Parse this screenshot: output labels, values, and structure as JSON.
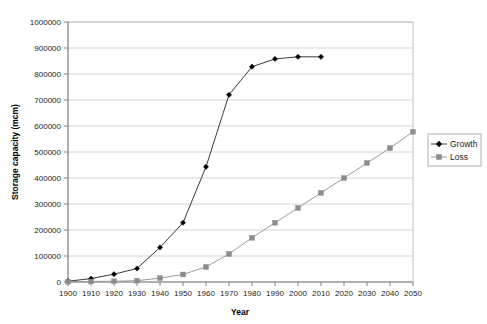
{
  "chart_data": {
    "type": "line",
    "title": "",
    "xlabel": "Year",
    "ylabel": "Storage capacity (mcm)",
    "x": [
      1900,
      1910,
      1920,
      1930,
      1940,
      1950,
      1960,
      1970,
      1980,
      1990,
      2000,
      2010,
      2020,
      2030,
      2040,
      2050
    ],
    "categories": [
      "1900",
      "1910",
      "1920",
      "1930",
      "1940",
      "1950",
      "1960",
      "1970",
      "1980",
      "1990",
      "2000",
      "2010",
      "2020",
      "2030",
      "2040",
      "2050"
    ],
    "series": [
      {
        "name": "Growth",
        "marker": "diamond",
        "color": "#000000",
        "x": [
          1900,
          1910,
          1920,
          1930,
          1940,
          1950,
          1960,
          1970,
          1980,
          1990,
          2000,
          2010
        ],
        "values": [
          3000,
          13000,
          30000,
          52000,
          133000,
          228000,
          443000,
          720000,
          828000,
          858000,
          866000,
          866000
        ]
      },
      {
        "name": "Loss",
        "marker": "square",
        "color": "#8c8c8c",
        "x": [
          1900,
          1910,
          1920,
          1930,
          1940,
          1950,
          1960,
          1970,
          1980,
          1990,
          2000,
          2010,
          2020,
          2030,
          2040,
          2050
        ],
        "values": [
          1000,
          2000,
          3000,
          5000,
          15000,
          29000,
          58000,
          108000,
          170000,
          228000,
          285000,
          343000,
          400000,
          458000,
          515000,
          578000
        ]
      }
    ],
    "xlim": [
      1900,
      2050
    ],
    "ylim": [
      0,
      1000000
    ],
    "ytick_step": 100000,
    "ytick_labels": [
      "0",
      "100000",
      "200000",
      "300000",
      "400000",
      "500000",
      "600000",
      "700000",
      "800000",
      "900000",
      "1000000"
    ],
    "grid": "horizontal",
    "legend_position": "right",
    "legend_entries": [
      "Growth",
      "Loss"
    ]
  },
  "axes": {
    "y_title": "Storage capacity (mcm)",
    "x_title": "Year"
  },
  "legend": {
    "items": [
      {
        "label": "Growth"
      },
      {
        "label": "Loss"
      }
    ]
  },
  "yticks": {
    "t0": "0",
    "t1": "100000",
    "t2": "200000",
    "t3": "300000",
    "t4": "400000",
    "t5": "500000",
    "t6": "600000",
    "t7": "700000",
    "t8": "800000",
    "t9": "900000",
    "t10": "1000000"
  },
  "xticks": {
    "t0": "1900",
    "t1": "1910",
    "t2": "1920",
    "t3": "1930",
    "t4": "1940",
    "t5": "1950",
    "t6": "1960",
    "t7": "1970",
    "t8": "1980",
    "t9": "1990",
    "t10": "2000",
    "t11": "2010",
    "t12": "2020",
    "t13": "2030",
    "t14": "2040",
    "t15": "2050"
  }
}
